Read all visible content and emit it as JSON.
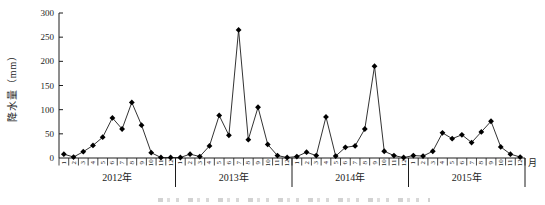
{
  "figure": {
    "background": "#ffffff",
    "axis_color": "#1c1c1c",
    "line_color": "#1c1c1c",
    "marker_color": "#000000",
    "marker_shape": "diamond"
  },
  "chart_data": {
    "type": "line",
    "title": "",
    "ylabel": "降水量（mm）",
    "xlabel": "月",
    "ylim": [
      0,
      300
    ],
    "yticks": [
      0,
      50,
      100,
      150,
      200,
      250,
      300
    ],
    "grid": false,
    "legend": null,
    "month_labels": [
      "1",
      "2",
      "3",
      "4",
      "5",
      "6",
      "7",
      "8",
      "9",
      "10",
      "11",
      "12"
    ],
    "series": [
      {
        "name": "降水量",
        "year_groups": [
          {
            "year": "2012年",
            "values": [
              8,
              2,
              13,
              26,
              43,
              83,
              60,
              115,
              68,
              11,
              1,
              1
            ]
          },
          {
            "year": "2013年",
            "values": [
              1,
              8,
              3,
              25,
              88,
              47,
              265,
              38,
              105,
              28,
              5,
              1
            ]
          },
          {
            "year": "2014年",
            "values": [
              3,
              12,
              5,
              85,
              4,
              22,
              25,
              60,
              190,
              14,
              5,
              1
            ]
          },
          {
            "year": "2015年",
            "values": [
              5,
              4,
              14,
              52,
              40,
              48,
              32,
              54,
              76,
              23,
              8,
              2
            ]
          }
        ]
      }
    ]
  }
}
